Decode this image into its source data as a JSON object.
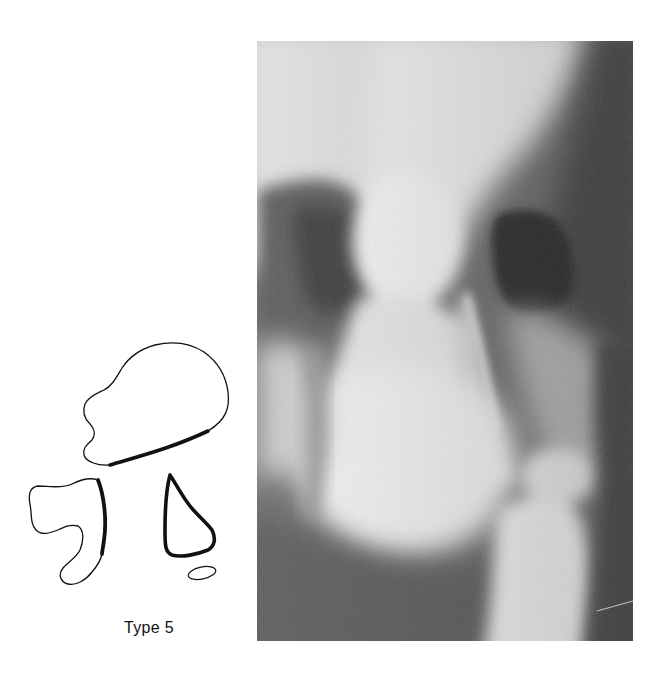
{
  "figure": {
    "caption": "Type 5",
    "diagram": {
      "description": "schematic tracing of joint bones with thickened (sclerotic) contour segments",
      "stroke_color": "#111111",
      "shapes": [
        {
          "name": "upper-bone-outline",
          "thick_segment": true
        },
        {
          "name": "left-bone-outline",
          "thick_segment": true
        },
        {
          "name": "triangular-bone-outline",
          "thick_segment": true
        },
        {
          "name": "small-ossicle-outline",
          "thick_segment": false
        }
      ]
    },
    "radiograph": {
      "description": "grayscale radiograph of joint",
      "colors": {
        "dark": "#3a3a3a",
        "mid": "#7a7a7a",
        "light": "#f4f4f4"
      }
    }
  }
}
